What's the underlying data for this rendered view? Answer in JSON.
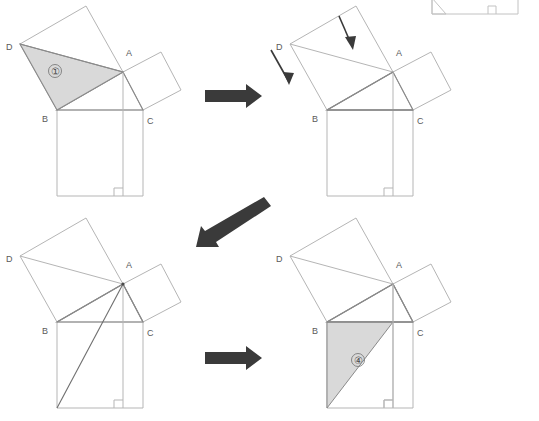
{
  "figure": {
    "canvas": {
      "width": 539,
      "height": 421
    },
    "colors": {
      "background": "#ffffff",
      "line": "#9a9a9a",
      "line_strong": "#6e6e6e",
      "shade_fill": "#d9d9d9",
      "shade_stroke": "#8a8a8a",
      "arrow": "#3a3a3a",
      "label_text": "#5a5a5a",
      "thin_line": "#b5b5b5"
    },
    "vertex_labels": {
      "a": "A",
      "b": "B",
      "c": "C",
      "d": "D"
    },
    "region_labels": {
      "one": "①",
      "four": "④"
    }
  },
  "panels": [
    {
      "id": "panel-top-left",
      "name": "panel-initial-shaded-triangle",
      "origin": {
        "x": 0,
        "y": 0
      },
      "labels": [
        {
          "name": "vertex-label-d",
          "text": "D",
          "x": 6,
          "y": 50
        },
        {
          "name": "vertex-label-a",
          "text": "A",
          "x": 126,
          "y": 56
        },
        {
          "name": "vertex-label-b",
          "text": "B",
          "x": 42,
          "y": 122
        },
        {
          "name": "vertex-label-c",
          "text": "C",
          "x": 147,
          "y": 124
        },
        {
          "name": "region-label-one",
          "text": "①",
          "x": 52,
          "y": 75
        }
      ],
      "shaded_region": "triangle D-A-B (region 1)"
    },
    {
      "id": "panel-top-right",
      "name": "panel-shear-arrows",
      "origin": {
        "x": 270,
        "y": 0
      },
      "labels": [
        {
          "name": "vertex-label-d",
          "text": "D",
          "x": 276,
          "y": 50
        },
        {
          "name": "vertex-label-a",
          "text": "A",
          "x": 396,
          "y": 56
        },
        {
          "name": "vertex-label-b",
          "text": "B",
          "x": 312,
          "y": 122
        },
        {
          "name": "vertex-label-c",
          "text": "C",
          "x": 417,
          "y": 124
        }
      ],
      "shaded_region": "none"
    },
    {
      "id": "panel-bottom-left",
      "name": "panel-cevian-to-corner",
      "origin": {
        "x": 0,
        "y": 210
      },
      "labels": [
        {
          "name": "vertex-label-d",
          "text": "D",
          "x": 6,
          "y": 262
        },
        {
          "name": "vertex-label-a",
          "text": "A",
          "x": 126,
          "y": 270
        },
        {
          "name": "vertex-label-b",
          "text": "B",
          "x": 42,
          "y": 334
        },
        {
          "name": "vertex-label-c",
          "text": "C",
          "x": 147,
          "y": 336
        }
      ],
      "shaded_region": "none"
    },
    {
      "id": "panel-bottom-right",
      "name": "panel-final-shaded-triangle",
      "origin": {
        "x": 270,
        "y": 210
      },
      "labels": [
        {
          "name": "vertex-label-d",
          "text": "D",
          "x": 276,
          "y": 262
        },
        {
          "name": "vertex-label-a",
          "text": "A",
          "x": 396,
          "y": 270
        },
        {
          "name": "vertex-label-b",
          "text": "B",
          "x": 312,
          "y": 334
        },
        {
          "name": "vertex-label-c",
          "text": "C",
          "x": 417,
          "y": 336
        },
        {
          "name": "region-label-four",
          "text": "④",
          "x": 355,
          "y": 362
        }
      ],
      "shaded_region": "triangle B-(bottom-left)-(foot of altitude) (region 4)"
    }
  ],
  "arrows": [
    {
      "name": "arrow-right-top",
      "type": "block-right",
      "from": {
        "x": 205,
        "y": 96
      },
      "to": {
        "x": 262,
        "y": 96
      }
    },
    {
      "name": "arrow-diagonal-middle",
      "type": "block-diagonal",
      "from": {
        "x": 268,
        "y": 200
      },
      "to": {
        "x": 196,
        "y": 247
      }
    },
    {
      "name": "arrow-right-bottom",
      "type": "block-right",
      "from": {
        "x": 205,
        "y": 358
      },
      "to": {
        "x": 262,
        "y": 358
      }
    },
    {
      "name": "arrow-shear-left",
      "type": "thin-down",
      "from": {
        "x": 271,
        "y": 50
      },
      "to": {
        "x": 291,
        "y": 85
      }
    },
    {
      "name": "arrow-shear-right",
      "type": "thin-down",
      "from": {
        "x": 339,
        "y": 16
      },
      "to": {
        "x": 354,
        "y": 50
      }
    }
  ],
  "fragment": {
    "name": "cropped-square-fragment-top-right",
    "description": "partial square bottom edge with right-angle marker, cropped at image top edge",
    "x": 432,
    "y": 0,
    "width": 86,
    "height": 14
  }
}
